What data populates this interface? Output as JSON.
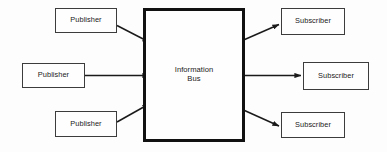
{
  "diagram": {
    "title_text": "Publish-Subscribe Information Bus",
    "background_color": "#fdfdfd",
    "line_color": "#1a1a1a",
    "hub_border_color": "#111111",
    "node_border_color": "#3c3c3c",
    "text_color": "#1a1a1a",
    "hub": {
      "label_line1": "Information",
      "label_line2": "Bus"
    },
    "publishers": [
      {
        "label": "Publisher"
      },
      {
        "label": "Publisher"
      },
      {
        "label": "Publisher"
      }
    ],
    "subscribers": [
      {
        "label": "Subscriber"
      },
      {
        "label": "Subscriber"
      },
      {
        "label": "Subscriber"
      }
    ],
    "edges": [
      {
        "name": "publisher-1-to-bus",
        "from": "publisher-top",
        "to": "information-bus",
        "direction": "right-down"
      },
      {
        "name": "publisher-2-to-bus",
        "from": "publisher-middle",
        "to": "information-bus",
        "direction": "right"
      },
      {
        "name": "publisher-3-to-bus",
        "from": "publisher-bottom",
        "to": "information-bus",
        "direction": "right-up"
      },
      {
        "name": "bus-to-subscriber-1",
        "from": "information-bus",
        "to": "subscriber-top",
        "direction": "right-up"
      },
      {
        "name": "bus-to-subscriber-2",
        "from": "information-bus",
        "to": "subscriber-middle",
        "direction": "right"
      },
      {
        "name": "bus-to-subscriber-3",
        "from": "information-bus",
        "to": "subscriber-bottom",
        "direction": "right-down"
      }
    ]
  }
}
